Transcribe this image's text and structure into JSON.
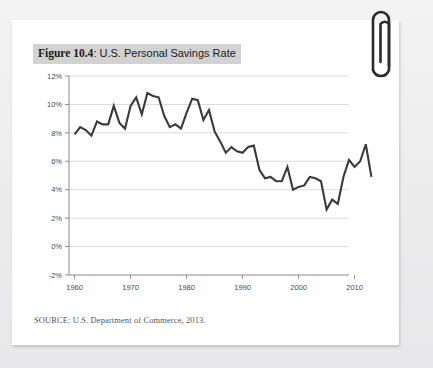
{
  "figure": {
    "number_label": "Figure 10.4",
    "separator": ": ",
    "title_rest": "U.S. Personal Savings Rate",
    "source": "SOURCE: U.S. Department of Commerce, 2013."
  },
  "decor": {
    "paperclip_name": "paperclip-icon",
    "paperclip_color": "#2b2b2b",
    "card_color": "#ffffff",
    "page_color": "#efeff0",
    "title_highlight_color": "#d2d2d2"
  },
  "chart_data": {
    "type": "line",
    "title": "U.S. Personal Savings Rate",
    "xlabel": "",
    "ylabel": "",
    "xlim": [
      1959,
      2014
    ],
    "ylim": [
      -2,
      12
    ],
    "ytick_values": [
      -2,
      0,
      2,
      4,
      6,
      8,
      10,
      12
    ],
    "ytick_labels": [
      "-2%",
      "0%",
      "2%",
      "4%",
      "6%",
      "8%",
      "10%",
      "12%"
    ],
    "xtick_values": [
      1960,
      1970,
      1980,
      1990,
      2000,
      2010
    ],
    "xtick_labels": [
      "1960",
      "1970",
      "1980",
      "1990",
      "2000",
      "2010"
    ],
    "grid": "horizontal",
    "legend": "none",
    "line_color": "#3a3a3a",
    "line_width": 2.1,
    "series": [
      {
        "name": "Personal Savings Rate",
        "x": [
          1960,
          1961,
          1962,
          1963,
          1964,
          1965,
          1966,
          1967,
          1968,
          1969,
          1970,
          1971,
          1972,
          1973,
          1974,
          1975,
          1976,
          1977,
          1978,
          1979,
          1980,
          1981,
          1982,
          1983,
          1984,
          1985,
          1986,
          1987,
          1988,
          1989,
          1990,
          1991,
          1992,
          1993,
          1994,
          1995,
          1996,
          1997,
          1998,
          1999,
          2000,
          2001,
          2002,
          2003,
          2004,
          2005,
          2006,
          2007,
          2008,
          2009,
          2010,
          2011,
          2012,
          2013
        ],
        "values": [
          7.9,
          8.4,
          8.2,
          7.8,
          8.8,
          8.6,
          8.6,
          9.9,
          8.7,
          8.3,
          9.9,
          10.5,
          9.3,
          10.8,
          10.6,
          10.5,
          9.2,
          8.4,
          8.6,
          8.3,
          9.4,
          10.4,
          10.3,
          8.9,
          9.6,
          8.1,
          7.4,
          6.6,
          7.0,
          6.7,
          6.6,
          7.0,
          7.1,
          5.4,
          4.8,
          4.9,
          4.6,
          4.6,
          5.6,
          4.0,
          4.2,
          4.3,
          4.9,
          4.8,
          4.6,
          2.6,
          3.3,
          3.0,
          4.9,
          6.1,
          5.6,
          6.0,
          7.2,
          4.9
        ]
      }
    ]
  }
}
